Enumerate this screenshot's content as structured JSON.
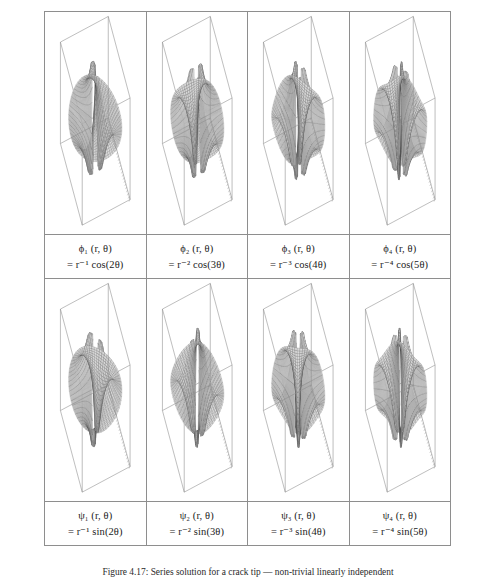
{
  "figure": {
    "caption": "Figure 4.17: Series solution for a crack tip — non-trivial linearly independent",
    "rows": 2,
    "columns": 4
  },
  "cells": [
    {
      "id": "phi-1",
      "plot_name": "surface-plot-phi-1",
      "label_line1": "ϕ₁ (r, θ)",
      "label_line2": "= r⁻¹ cos(2θ)",
      "function_symbol": "ϕ",
      "index": 1,
      "exponent": -1,
      "trig": "cos",
      "theta_multiple": 2
    },
    {
      "id": "phi-2",
      "plot_name": "surface-plot-phi-2",
      "label_line1": "ϕ₂ (r, θ)",
      "label_line2": "= r⁻² cos(3θ)",
      "function_symbol": "ϕ",
      "index": 2,
      "exponent": -2,
      "trig": "cos",
      "theta_multiple": 3
    },
    {
      "id": "phi-3",
      "plot_name": "surface-plot-phi-3",
      "label_line1": "ϕ₃ (r, θ)",
      "label_line2": "= r⁻³ cos(4θ)",
      "function_symbol": "ϕ",
      "index": 3,
      "exponent": -3,
      "trig": "cos",
      "theta_multiple": 4
    },
    {
      "id": "phi-4",
      "plot_name": "surface-plot-phi-4",
      "label_line1": "ϕ₄ (r, θ)",
      "label_line2": "= r⁻⁴ cos(5θ)",
      "function_symbol": "ϕ",
      "index": 4,
      "exponent": -4,
      "trig": "cos",
      "theta_multiple": 5
    },
    {
      "id": "psi-1",
      "plot_name": "surface-plot-psi-1",
      "label_line1": "ψ₁ (r, θ)",
      "label_line2": "= r⁻¹ sin(2θ)",
      "function_symbol": "ψ",
      "index": 1,
      "exponent": -1,
      "trig": "sin",
      "theta_multiple": 2
    },
    {
      "id": "psi-2",
      "plot_name": "surface-plot-psi-2",
      "label_line1": "ψ₂ (r, θ)",
      "label_line2": "= r⁻² sin(3θ)",
      "function_symbol": "ψ",
      "index": 2,
      "exponent": -2,
      "trig": "sin",
      "theta_multiple": 3
    },
    {
      "id": "psi-3",
      "plot_name": "surface-plot-psi-3",
      "label_line1": "ψ₃ (r, θ)",
      "label_line2": "= r⁻³ sin(4θ)",
      "function_symbol": "ψ",
      "index": 3,
      "exponent": -3,
      "trig": "sin",
      "theta_multiple": 4
    },
    {
      "id": "psi-4",
      "plot_name": "surface-plot-psi-4",
      "label_line1": "ψ₄ (r, θ)",
      "label_line2": "= r⁻⁴ sin(5θ)",
      "function_symbol": "ψ",
      "index": 4,
      "exponent": -4,
      "trig": "sin",
      "theta_multiple": 5
    }
  ],
  "chart_data": {
    "type": "surface",
    "title": "Series solution for a crack tip",
    "plot_style": "3d wireframe mesh on axis box, no tick labels",
    "common": {
      "xlabel": "",
      "ylabel": "",
      "zlabel": "",
      "grid": false,
      "legend": false,
      "box_visible": true,
      "base_ticks": true,
      "mesh_color": "#4a4a4a",
      "box_color": "#8e8e8e",
      "surface_fill": "#d7d7d7"
    },
    "series": [
      {
        "name": "ϕ₁ = r⁻¹ cos(2θ)",
        "lobes": 4,
        "radial_exponent": -1,
        "angular_mode": 2,
        "phase": "cos"
      },
      {
        "name": "ϕ₂ = r⁻² cos(3θ)",
        "lobes": 6,
        "radial_exponent": -2,
        "angular_mode": 3,
        "phase": "cos"
      },
      {
        "name": "ϕ₃ = r⁻³ cos(4θ)",
        "lobes": 8,
        "radial_exponent": -3,
        "angular_mode": 4,
        "phase": "cos"
      },
      {
        "name": "ϕ₄ = r⁻⁴ cos(5θ)",
        "lobes": 10,
        "radial_exponent": -4,
        "angular_mode": 5,
        "phase": "cos"
      },
      {
        "name": "ψ₁ = r⁻¹ sin(2θ)",
        "lobes": 4,
        "radial_exponent": -1,
        "angular_mode": 2,
        "phase": "sin"
      },
      {
        "name": "ψ₂ = r⁻² sin(3θ)",
        "lobes": 6,
        "radial_exponent": -2,
        "angular_mode": 3,
        "phase": "sin"
      },
      {
        "name": "ψ₃ = r⁻³ sin(4θ)",
        "lobes": 8,
        "radial_exponent": -3,
        "angular_mode": 4,
        "phase": "sin"
      },
      {
        "name": "ψ₄ = r⁻⁴ sin(5θ)",
        "lobes": 10,
        "radial_exponent": -4,
        "angular_mode": 5,
        "phase": "sin"
      }
    ]
  }
}
